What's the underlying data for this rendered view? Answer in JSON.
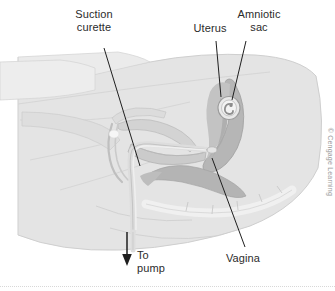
{
  "figure": {
    "width": 335,
    "height": 291,
    "background": "#ffffff"
  },
  "labels": {
    "suction_curette": "Suction\ncurette",
    "uterus": "Uterus",
    "amniotic_sac": "Amniotic\nsac",
    "vagina": "Vagina",
    "to_pump": "To\npump"
  },
  "credit": {
    "text": "© Cengage Learning"
  },
  "colors": {
    "body_fill": "#e2e2e2",
    "body_fill_light": "#ededed",
    "body_outline": "#c8c8c8",
    "organ_mid": "#c9c9c9",
    "organ_dark": "#b0b0b0",
    "uterus_fill": "#b9b9b9",
    "rectum_fill": "#bdbdbd",
    "bone_light": "#f2f2f2",
    "instrument": "#d7d7d7",
    "leader_line": "#1f1f1f",
    "text": "#2b2b2b",
    "credit_text": "#9a9a9a"
  },
  "annotations": [
    {
      "name": "suction-curette",
      "leader_from": [
        104,
        48
      ],
      "leader_to": [
        139,
        163
      ]
    },
    {
      "name": "uterus",
      "leader_from": [
        216,
        40
      ],
      "leader_to": [
        221,
        96
      ]
    },
    {
      "name": "amniotic-sac",
      "leader_from": [
        245,
        40
      ],
      "leader_to": [
        231,
        101
      ]
    },
    {
      "name": "vagina",
      "leader_from": [
        246,
        249
      ],
      "leader_to": [
        212,
        158
      ]
    },
    {
      "name": "to-pump",
      "arrow_from": [
        127,
        232
      ],
      "arrow_to": [
        127,
        262
      ]
    }
  ]
}
